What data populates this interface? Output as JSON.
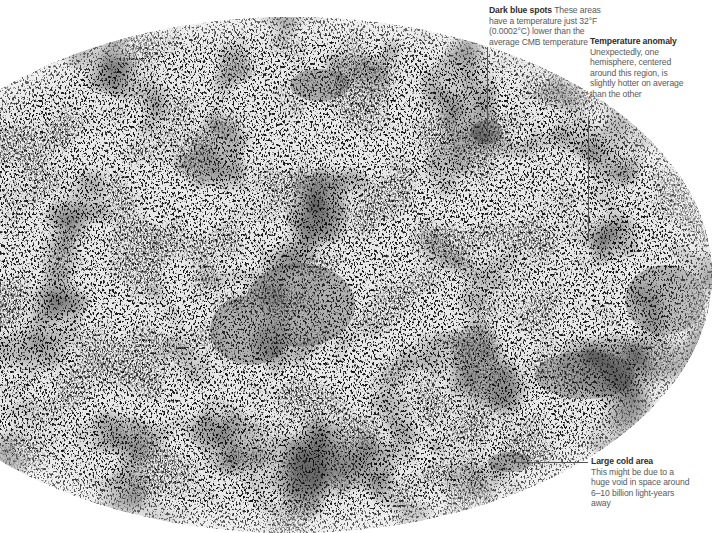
{
  "figure": {
    "colors": {
      "background": "#ffffff",
      "map_light": "#e6e6e6",
      "map_dark": "#3a3a3a",
      "text_title": "#2e2e2e",
      "text_body": "#5a5a5a",
      "leader_line": "#555555"
    }
  },
  "callouts": {
    "dark_blue_spots": {
      "title": "Dark blue spots",
      "body": "These areas have a temperature just 32°F (0.0002°C) lower than the average CMB temperature"
    },
    "temperature_anomaly": {
      "title": "Temperature anomaly",
      "body": "Unexpectedly, one hemisphere, centered around this region, is slightly hotter on average than the other"
    },
    "large_cold_area": {
      "title": "Large cold area",
      "body": "This might be due to a huge void in space around 6–10 billion light-years away"
    }
  }
}
